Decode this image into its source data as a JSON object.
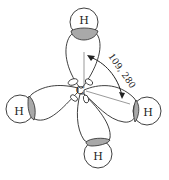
{
  "diagram": {
    "center_atom": {
      "label": "C"
    },
    "hydrogens": [
      {
        "id": "top",
        "label": "H"
      },
      {
        "id": "left",
        "label": "H"
      },
      {
        "id": "right",
        "label": "H"
      },
      {
        "id": "bottom",
        "label": "H"
      }
    ],
    "angle": {
      "label": "109, 280"
    },
    "colors": {
      "overlap_fill": "#a9a9a9",
      "stroke": "#2a2a2a",
      "background": "#ffffff"
    }
  }
}
